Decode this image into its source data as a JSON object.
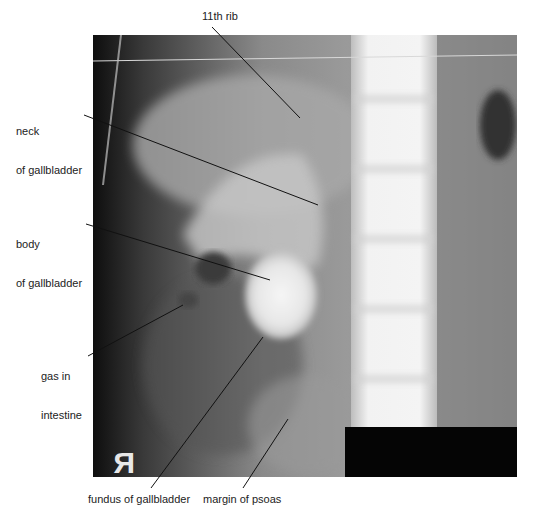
{
  "figure": {
    "type": "radiograph",
    "view": "abdominal x-ray with contrast-filled gallbladder",
    "side_marker": "R"
  },
  "labels": [
    {
      "id": "11th-rib",
      "text": "11th rib"
    },
    {
      "id": "neck-of-gallbladder",
      "line1": "neck",
      "line2": "of gallbladder"
    },
    {
      "id": "body-of-gallbladder",
      "line1": "body",
      "line2": "of gallbladder"
    },
    {
      "id": "gas-in-intestine",
      "line1": "gas in",
      "line2": "intestine"
    },
    {
      "id": "fundus-of-gallbladder",
      "text": "fundus of gallbladder"
    },
    {
      "id": "margin-of-psoas",
      "text": "margin of psoas"
    }
  ]
}
